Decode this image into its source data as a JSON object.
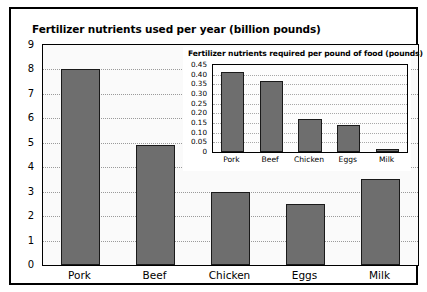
{
  "chart_data": [
    {
      "type": "bar",
      "id": "main",
      "title": "Fertilizer nutrients used per year (billion pounds)",
      "xlabel": "",
      "ylabel": "",
      "categories": [
        "Pork",
        "Beef",
        "Chicken",
        "Eggs",
        "Milk"
      ],
      "values": [
        8.0,
        4.9,
        3.0,
        2.5,
        3.5
      ],
      "ylim": [
        0,
        9
      ],
      "yticks": [
        "0",
        "1",
        "2",
        "3",
        "4",
        "5",
        "6",
        "7",
        "8",
        "9"
      ],
      "ytick_values": [
        0,
        1,
        2,
        3,
        4,
        5,
        6,
        7,
        8,
        9
      ],
      "grid": true,
      "legend": "none",
      "bar_color": "#6e6e6e",
      "bar_edge_color": "#1a1a1a",
      "plot_background": "#fafafa"
    },
    {
      "type": "bar",
      "id": "inset",
      "title": "Fertilizer nutrients required per pound of food (pounds)",
      "xlabel": "",
      "ylabel": "",
      "categories": [
        "Pork",
        "Beef",
        "Chicken",
        "Eggs",
        "Milk"
      ],
      "values": [
        0.415,
        0.365,
        0.17,
        0.14,
        0.015
      ],
      "ylim": [
        0,
        0.45
      ],
      "yticks": [
        "0",
        "0.05",
        "0.10",
        "0.15",
        "0.20",
        "0.25",
        "0.30",
        "0.35",
        "0.40",
        "0.45"
      ],
      "ytick_values": [
        0,
        0.05,
        0.1,
        0.15,
        0.2,
        0.25,
        0.3,
        0.35,
        0.4,
        0.45
      ],
      "grid": true,
      "legend": "none",
      "bar_color": "#6e6e6e",
      "bar_edge_color": "#1a1a1a",
      "plot_background": "#fdfdfd"
    }
  ],
  "frame": {
    "border_color": "#000000",
    "background": "#ffffff"
  }
}
